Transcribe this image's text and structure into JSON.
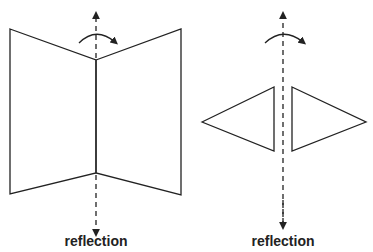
{
  "panels": [
    {
      "label": "reflection",
      "shape": "open-book-planes",
      "axis": "vertical-dashed-arrow",
      "rotation": "curved-arrow-clockwise"
    },
    {
      "label": "reflection",
      "shape": "mirrored-triangles",
      "axis": "vertical-dashed-arrow",
      "rotation": "curved-arrow-clockwise"
    }
  ],
  "colors": {
    "stroke": "#222222",
    "background": "#ffffff"
  }
}
